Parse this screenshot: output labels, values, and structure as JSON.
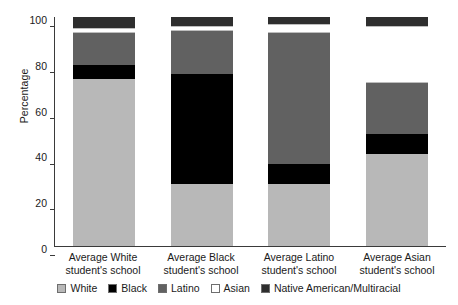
{
  "chart_data": {
    "type": "bar",
    "title": "",
    "subtitle": "",
    "xlabel": "",
    "ylabel": "Percentage",
    "ylim": [
      0,
      100
    ],
    "yticks": [
      0,
      20,
      40,
      60,
      80,
      100
    ],
    "ytick_labels": [
      "0",
      "20",
      "40",
      "60",
      "80",
      "100"
    ],
    "grid": false,
    "stacked": true,
    "legend_position": "bottom",
    "categories": [
      "Average White student's school",
      "Average Black student's school",
      "Average Latino student's school",
      "Average Asian student's school"
    ],
    "category_lines": [
      [
        "Average White",
        "student's school"
      ],
      [
        "Average Black",
        "student's school"
      ],
      [
        "Average Latino",
        "student's school"
      ],
      [
        "Average Asian",
        "student's school"
      ]
    ],
    "series": [
      {
        "name": "White",
        "color": "#b8b8b8",
        "values": [
          73,
          27,
          27,
          40
        ]
      },
      {
        "name": "Black",
        "color": "#000000",
        "values": [
          6,
          48,
          9,
          9
        ]
      },
      {
        "name": "Latino",
        "color": "#616161",
        "values": [
          14,
          19,
          57,
          22
        ]
      },
      {
        "name": "Asian",
        "color": "#ffffff",
        "values": [
          2,
          2,
          4,
          25
        ]
      },
      {
        "name": "Native American/Multiracial",
        "color": "#2e2e2e",
        "values": [
          5,
          4,
          3,
          4
        ]
      }
    ],
    "stack_order_bottom_to_top": [
      "White",
      "Black",
      "Latino",
      "Asian",
      "Native American/Multiracial"
    ],
    "legend": [
      {
        "label": "White",
        "color": "#b8b8b8"
      },
      {
        "label": "Black",
        "color": "#000000"
      },
      {
        "label": "Latino",
        "color": "#616161"
      },
      {
        "label": "Asian",
        "color": "#ffffff"
      },
      {
        "label": "Native American/Multiracial",
        "color": "#2e2e2e"
      }
    ]
  }
}
